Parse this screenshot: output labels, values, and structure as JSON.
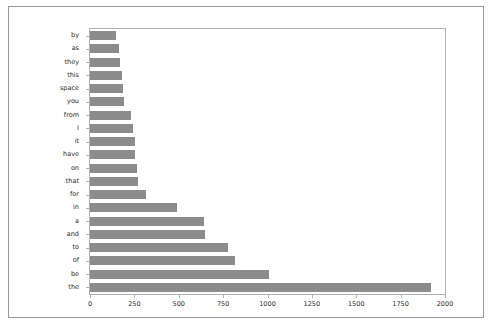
{
  "figure": {
    "background_color": "#ffffff",
    "frame_color": "#9a9a9a",
    "axes_border_color": "#b0b0b0",
    "bar_color": "#8c8c8c",
    "tick_color": "#2b2b2b"
  },
  "chart_data": {
    "type": "bar",
    "orientation": "horizontal",
    "title": "",
    "xlabel": "",
    "ylabel": "",
    "grid": false,
    "legend": false,
    "xlim": [
      0,
      2000
    ],
    "xticks": [
      0,
      250,
      500,
      750,
      1000,
      1250,
      1500,
      1750,
      2000
    ],
    "xtick_labels": [
      "0",
      "250",
      "500",
      "750",
      "1000",
      "1250",
      "1500",
      "1750",
      "2000"
    ],
    "categories": [
      "by",
      "as",
      "they",
      "this",
      "space",
      "you",
      "from",
      "I",
      "it",
      "have",
      "on",
      "that",
      "for",
      "in",
      "a",
      "and",
      "to",
      "of",
      "be",
      "the"
    ],
    "values": [
      145,
      163,
      168,
      182,
      184,
      190,
      232,
      240,
      252,
      255,
      262,
      272,
      318,
      492,
      645,
      650,
      775,
      818,
      1010,
      1920
    ]
  }
}
